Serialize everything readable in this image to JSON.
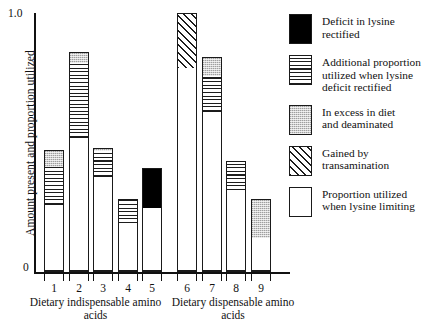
{
  "chart_data": {
    "type": "bar",
    "title": "",
    "subtitle": "",
    "xlabel": "",
    "ylabel": "Amount present and proportion utilized",
    "ylim": [
      0,
      1.0
    ],
    "ytick_labels": [
      "1.0",
      "0"
    ],
    "ytick_values": [
      1.0,
      0
    ],
    "grid": false,
    "stacked": true,
    "legend_position": "right",
    "categories": [
      "1",
      "2",
      "3",
      "4",
      "5",
      "6",
      "7",
      "8",
      "9"
    ],
    "groups": [
      {
        "label": "Dietary indispensable amino acids",
        "categories": [
          "1",
          "2",
          "3",
          "4",
          "5"
        ]
      },
      {
        "label": "Dietary dispensable amino acids",
        "categories": [
          "6",
          "7",
          "8",
          "9"
        ]
      }
    ],
    "series": [
      {
        "name": "Proportion utilized when lysine limiting",
        "fill": "white",
        "values": [
          0.26,
          0.52,
          0.37,
          0.19,
          0.25,
          0.79,
          0.62,
          0.32,
          0.13
        ]
      },
      {
        "name": "Additional proportion utilized when lysine deficit rectified",
        "fill": "lines",
        "values": [
          0.15,
          0.29,
          0.1,
          0.09,
          0.0,
          0.0,
          0.14,
          0.11,
          0.0
        ]
      },
      {
        "name": "Deficit in lysine rectified",
        "fill": "black",
        "values": [
          0.0,
          0.0,
          0.0,
          0.0,
          0.15,
          0.0,
          0.0,
          0.0,
          0.0
        ]
      },
      {
        "name": "Gained by transamination",
        "fill": "hatch",
        "values": [
          0.0,
          0.0,
          0.0,
          0.0,
          0.0,
          0.21,
          0.0,
          0.0,
          0.0
        ]
      },
      {
        "name": "In excess in diet and deaminated",
        "fill": "gray",
        "values": [
          0.06,
          0.04,
          0.01,
          0.0,
          0.0,
          0.0,
          0.07,
          0.0,
          0.15
        ]
      }
    ],
    "totals": [
      0.47,
      0.85,
      0.48,
      0.28,
      0.4,
      1.0,
      0.83,
      0.43,
      0.28
    ],
    "bars": [
      {
        "category": "1",
        "total": 0.47,
        "segments": [
          {
            "fill": "white",
            "from": 0.0,
            "to": 0.26
          },
          {
            "fill": "lines",
            "from": 0.26,
            "to": 0.41
          },
          {
            "fill": "gray",
            "from": 0.41,
            "to": 0.47
          }
        ]
      },
      {
        "category": "2",
        "total": 0.85,
        "segments": [
          {
            "fill": "white",
            "from": 0.0,
            "to": 0.52
          },
          {
            "fill": "lines",
            "from": 0.52,
            "to": 0.81
          },
          {
            "fill": "gray",
            "from": 0.81,
            "to": 0.85
          }
        ]
      },
      {
        "category": "3",
        "total": 0.48,
        "segments": [
          {
            "fill": "white",
            "from": 0.0,
            "to": 0.37
          },
          {
            "fill": "lines",
            "from": 0.37,
            "to": 0.47
          },
          {
            "fill": "gray",
            "from": 0.47,
            "to": 0.48
          }
        ]
      },
      {
        "category": "4",
        "total": 0.28,
        "segments": [
          {
            "fill": "white",
            "from": 0.0,
            "to": 0.19
          },
          {
            "fill": "lines",
            "from": 0.19,
            "to": 0.28
          }
        ]
      },
      {
        "category": "5",
        "total": 0.4,
        "segments": [
          {
            "fill": "white",
            "from": 0.0,
            "to": 0.25
          },
          {
            "fill": "black",
            "from": 0.25,
            "to": 0.4
          }
        ]
      },
      {
        "category": "6",
        "total": 1.0,
        "segments": [
          {
            "fill": "white",
            "from": 0.0,
            "to": 0.79
          },
          {
            "fill": "hatch",
            "from": 0.79,
            "to": 1.0
          }
        ]
      },
      {
        "category": "7",
        "total": 0.83,
        "segments": [
          {
            "fill": "white",
            "from": 0.0,
            "to": 0.62
          },
          {
            "fill": "lines",
            "from": 0.62,
            "to": 0.76
          },
          {
            "fill": "gray",
            "from": 0.76,
            "to": 0.83
          }
        ]
      },
      {
        "category": "8",
        "total": 0.43,
        "segments": [
          {
            "fill": "white",
            "from": 0.0,
            "to": 0.32
          },
          {
            "fill": "lines",
            "from": 0.32,
            "to": 0.43
          }
        ]
      },
      {
        "category": "9",
        "total": 0.28,
        "segments": [
          {
            "fill": "white",
            "from": 0.0,
            "to": 0.13
          },
          {
            "fill": "gray",
            "from": 0.13,
            "to": 0.28
          }
        ]
      }
    ],
    "legend": [
      {
        "fill": "black",
        "label": "Deficit in lysine\nrectified",
        "line1": "Deficit in lysine",
        "line2": "rectified",
        "line3": ""
      },
      {
        "fill": "lines",
        "label": "Additional proportion utilized when lysine deficit rectified",
        "line1": "Additional proportion",
        "line2": "utilized when lysine",
        "line3": "deficit rectified"
      },
      {
        "fill": "gray",
        "label": "In excess in diet and deaminated",
        "line1": "In excess in diet",
        "line2": "and deaminated",
        "line3": ""
      },
      {
        "fill": "hatch",
        "label": "Gained by transamination",
        "line1": "Gained by",
        "line2": "transamination",
        "line3": ""
      },
      {
        "fill": "white",
        "label": "Proportion utilized when lysine limiting",
        "line1": "Proportion utilized",
        "line2": "when lysine limiting",
        "line3": ""
      }
    ],
    "colors": {
      "axis": "#111111",
      "outline": "#1a1a1a",
      "black_fill": "#000000",
      "gray_fill": "#cfcfcf",
      "white_fill": "#ffffff",
      "background": "#ffffff"
    }
  }
}
